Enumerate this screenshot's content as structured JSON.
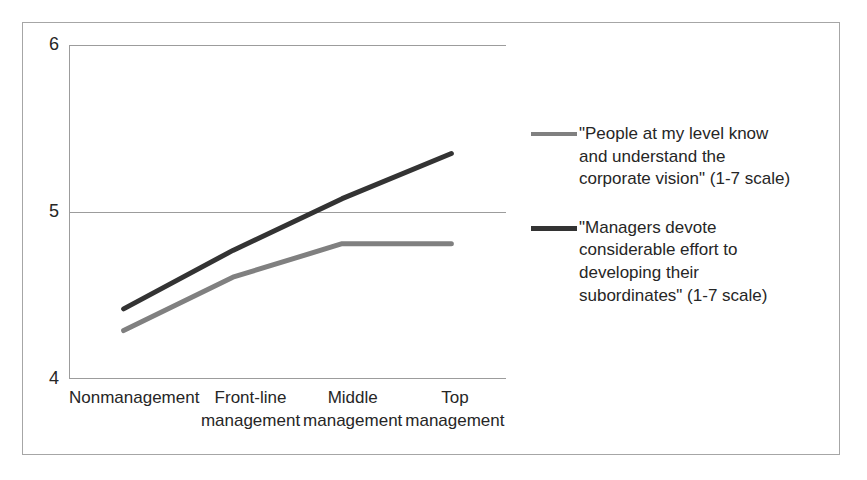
{
  "chart_data": {
    "type": "line",
    "title": "",
    "xlabel": "",
    "ylabel": "",
    "ylim": [
      4,
      6
    ],
    "yticks": [
      "4",
      "5",
      "6"
    ],
    "grid": true,
    "legend_position": "right",
    "categories": [
      "Nonmanagement",
      "Front-line management",
      "Middle management",
      "Top management"
    ],
    "category_lines": [
      [
        "Nonmanagement",
        ""
      ],
      [
        "Front-line",
        "management"
      ],
      [
        "Middle",
        "management"
      ],
      [
        "Top",
        "management"
      ]
    ],
    "series": [
      {
        "name": "\"People at my level know and understand the corporate vision\" (1-7 scale)",
        "name_lines": [
          "\"People at my level know",
          "and understand the",
          "corporate vision\" (1-7 scale)"
        ],
        "color": "#808080",
        "values": [
          4.29,
          4.61,
          4.81,
          4.81
        ]
      },
      {
        "name": "\"Managers devote considerable effort to developing their subordinates\" (1-7 scale)",
        "name_lines": [
          "\"Managers devote",
          "considerable effort to",
          "developing their",
          "subordinates\" (1-7 scale)"
        ],
        "color": "#333333",
        "values": [
          4.42,
          4.77,
          5.08,
          5.35
        ]
      }
    ]
  },
  "colors": {
    "border": "#a6a6a6",
    "grid": "#9c9c9c",
    "text": "#262626",
    "series_gray": "#808080",
    "series_dark": "#333333"
  }
}
